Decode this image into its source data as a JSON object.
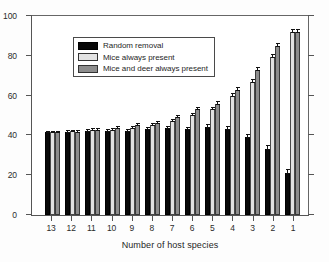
{
  "chart_data": {
    "type": "bar",
    "title": "",
    "subtitle": "",
    "xlabel": "Number of host species",
    "ylabel": "",
    "ylim": [
      0,
      100
    ],
    "yticks": [
      0,
      20,
      40,
      60,
      80,
      100
    ],
    "grid": false,
    "legend_position": "upper left (inside plot)",
    "categories": [
      "13",
      "12",
      "11",
      "10",
      "9",
      "8",
      "7",
      "6",
      "5",
      "4",
      "3",
      "2",
      "1"
    ],
    "series": [
      {
        "name": "Random removal",
        "color": "#080808",
        "values": [
          41.2,
          41.5,
          42.0,
          41.8,
          41.8,
          43.0,
          43.2,
          42.8,
          44.0,
          42.8,
          38.6,
          32.8,
          21.0
        ],
        "errors": [
          0.3,
          0.4,
          0.4,
          0.4,
          0.5,
          0.5,
          0.6,
          0.7,
          0.9,
          1.0,
          1.2,
          1.3,
          1.2
        ]
      },
      {
        "name": "Mice always present",
        "color": "#e3e3e3",
        "values": [
          41.2,
          41.6,
          42.2,
          42.5,
          43.2,
          44.8,
          46.8,
          49.8,
          52.6,
          59.4,
          66.3,
          78.8,
          91.2
        ],
        "errors": [
          0.3,
          0.4,
          0.5,
          0.5,
          0.5,
          0.6,
          0.6,
          0.7,
          0.8,
          0.9,
          1.0,
          1.0,
          0.8
        ]
      },
      {
        "name": "Mice and deer always present",
        "color": "#8d8d8d",
        "values": [
          41.2,
          41.3,
          42.3,
          43.2,
          44.6,
          45.8,
          48.6,
          52.6,
          55.4,
          62.4,
          72.0,
          84.2,
          91.2
        ],
        "errors": [
          0.3,
          0.4,
          0.5,
          0.5,
          0.6,
          0.6,
          0.7,
          0.8,
          0.9,
          1.0,
          1.1,
          1.0,
          0.8
        ]
      }
    ]
  },
  "legend": {
    "items": [
      {
        "label": "Random removal",
        "swatch": "s0"
      },
      {
        "label": "Mice always present",
        "swatch": "s1"
      },
      {
        "label": "Mice and deer always present",
        "swatch": "s2"
      }
    ]
  }
}
